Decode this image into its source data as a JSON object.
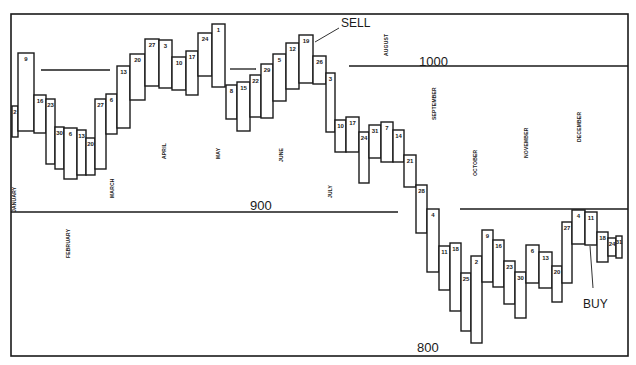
{
  "chart_data": {
    "type": "bar",
    "subtype": "weekly high-low range (floating box) chart",
    "title": "",
    "xlabel": "Week (day of month)",
    "ylabel": "Index level",
    "ylim": [
      780,
      1020
    ],
    "grid": false,
    "reference_lines": [
      {
        "label": "1000",
        "value": 1000
      },
      {
        "label": "900",
        "value": 900
      },
      {
        "label": "800",
        "value": 800
      }
    ],
    "months": [
      "JANUARY",
      "FEBRUARY",
      "MARCH",
      "APRIL",
      "MAY",
      "JUNE",
      "JULY",
      "AUGUST",
      "SEPTEMBER",
      "OCTOBER",
      "NOVEMBER",
      "DECEMBER"
    ],
    "annotations": [
      {
        "text": "SELL",
        "at_week": "Jun 19"
      },
      {
        "text": "BUY",
        "at_week": "Dec 11"
      }
    ],
    "categories": [
      "Jan 2",
      "Jan 9",
      "Jan 16",
      "Jan 23",
      "Jan 30",
      "Feb 6",
      "Feb 13",
      "Feb 20",
      "Feb 27",
      "Mar 6",
      "Mar 13",
      "Mar 20",
      "Mar 27",
      "Apr 3",
      "Apr 10",
      "Apr 17",
      "Apr 24",
      "May 1",
      "May 8",
      "May 15",
      "May 22",
      "May 29",
      "Jun 5",
      "Jun 12",
      "Jun 19",
      "Jun 26",
      "Jul 3",
      "Jul 10",
      "Jul 17",
      "Jul 24",
      "Jul 31",
      "Aug 7",
      "Aug 14",
      "Aug 21",
      "Aug 28",
      "Sep 4",
      "Sep 11",
      "Sep 18",
      "Sep 25",
      "Oct 2",
      "Oct 9",
      "Oct 16",
      "Oct 23",
      "Oct 30",
      "Nov 6",
      "Nov 13",
      "Nov 20",
      "Nov 27",
      "Dec 4",
      "Dec 11",
      "Dec 18",
      "Dec 24",
      "Dec 31"
    ],
    "series": [
      {
        "name": "High",
        "values": [
          956,
          982,
          965,
          963,
          951,
          951,
          950,
          947,
          963,
          965,
          975,
          980,
          986,
          986,
          979,
          981,
          989,
          992,
          966,
          967,
          970,
          974,
          980,
          984,
          987,
          978,
          971,
          952,
          953,
          946,
          949,
          950,
          947,
          937,
          924,
          913,
          896,
          897,
          884,
          890,
          902,
          898,
          888,
          884,
          896,
          893,
          887,
          907,
          912,
          912,
          902,
          900,
          900
        ]
      },
      {
        "name": "Low",
        "values": [
          943,
          948,
          947,
          934,
          932,
          928,
          930,
          930,
          932,
          949,
          952,
          964,
          970,
          969,
          968,
          966,
          974,
          969,
          955,
          950,
          955,
          955,
          963,
          968,
          970,
          970,
          945,
          936,
          936,
          929,
          943,
          941,
          941,
          931,
          910,
          883,
          875,
          866,
          857,
          852,
          875,
          873,
          865,
          859,
          875,
          873,
          866,
          875,
          896,
          896,
          883,
          886,
          885
        ]
      }
    ],
    "boxes": [
      {
        "label": "2",
        "x": 12,
        "w": 6,
        "top": 106,
        "bottom": 137
      },
      {
        "label": "9",
        "x": 18,
        "w": 16,
        "top": 53,
        "bottom": 131
      },
      {
        "label": "16",
        "x": 34,
        "w": 12,
        "top": 95,
        "bottom": 133
      },
      {
        "label": "23",
        "x": 46,
        "w": 9,
        "top": 99,
        "bottom": 164
      },
      {
        "label": "30",
        "x": 55,
        "w": 9,
        "top": 127,
        "bottom": 169
      },
      {
        "label": "6",
        "x": 64,
        "w": 13,
        "top": 128,
        "bottom": 179
      },
      {
        "label": "13",
        "x": 77,
        "w": 9,
        "top": 130,
        "bottom": 175
      },
      {
        "label": "20",
        "x": 86,
        "w": 9,
        "top": 138,
        "bottom": 175
      },
      {
        "label": "27",
        "x": 95,
        "w": 11,
        "top": 99,
        "bottom": 169
      },
      {
        "label": "6",
        "x": 106,
        "w": 11,
        "top": 94,
        "bottom": 134
      },
      {
        "label": "13",
        "x": 117,
        "w": 13,
        "top": 66,
        "bottom": 128
      },
      {
        "label": "20",
        "x": 130,
        "w": 15,
        "top": 54,
        "bottom": 100
      },
      {
        "label": "27",
        "x": 145,
        "w": 14,
        "top": 39,
        "bottom": 86
      },
      {
        "label": "3",
        "x": 159,
        "w": 13,
        "top": 40,
        "bottom": 88
      },
      {
        "label": "10",
        "x": 172,
        "w": 14,
        "top": 57,
        "bottom": 90
      },
      {
        "label": "17",
        "x": 186,
        "w": 12,
        "top": 51,
        "bottom": 95
      },
      {
        "label": "24",
        "x": 198,
        "w": 14,
        "top": 33,
        "bottom": 76
      },
      {
        "label": "1",
        "x": 212,
        "w": 13,
        "top": 24,
        "bottom": 87
      },
      {
        "label": "8",
        "x": 226,
        "w": 11,
        "top": 85,
        "bottom": 119
      },
      {
        "label": "15",
        "x": 237,
        "w": 13,
        "top": 82,
        "bottom": 131
      },
      {
        "label": "22",
        "x": 250,
        "w": 11,
        "top": 75,
        "bottom": 117
      },
      {
        "label": "29",
        "x": 261,
        "w": 12,
        "top": 64,
        "bottom": 118
      },
      {
        "label": "5",
        "x": 273,
        "w": 13,
        "top": 54,
        "bottom": 101
      },
      {
        "label": "12",
        "x": 286,
        "w": 13,
        "top": 43,
        "bottom": 89
      },
      {
        "label": "19",
        "x": 299,
        "w": 14,
        "top": 35,
        "bottom": 83
      },
      {
        "label": "26",
        "x": 313,
        "w": 13,
        "top": 56,
        "bottom": 84
      },
      {
        "label": "3",
        "x": 326,
        "w": 9,
        "top": 73,
        "bottom": 132
      },
      {
        "label": "10",
        "x": 335,
        "w": 11,
        "top": 120,
        "bottom": 152
      },
      {
        "label": "17",
        "x": 346,
        "w": 13,
        "top": 117,
        "bottom": 152
      },
      {
        "label": "24",
        "x": 359,
        "w": 10,
        "top": 132,
        "bottom": 183
      },
      {
        "label": "31",
        "x": 369,
        "w": 12,
        "top": 125,
        "bottom": 158
      },
      {
        "label": "7",
        "x": 381,
        "w": 12,
        "top": 122,
        "bottom": 162
      },
      {
        "label": "14",
        "x": 393,
        "w": 11,
        "top": 130,
        "bottom": 162
      },
      {
        "label": "21",
        "x": 404,
        "w": 12,
        "top": 155,
        "bottom": 187
      },
      {
        "label": "28",
        "x": 416,
        "w": 11,
        "top": 185,
        "bottom": 233
      },
      {
        "label": "4",
        "x": 427,
        "w": 12,
        "top": 209,
        "bottom": 272
      },
      {
        "label": "11",
        "x": 439,
        "w": 11,
        "top": 246,
        "bottom": 290
      },
      {
        "label": "18",
        "x": 450,
        "w": 11,
        "top": 243,
        "bottom": 311
      },
      {
        "label": "25",
        "x": 461,
        "w": 10,
        "top": 273,
        "bottom": 331
      },
      {
        "label": "2",
        "x": 471,
        "w": 11,
        "top": 256,
        "bottom": 343
      },
      {
        "label": "9",
        "x": 482,
        "w": 11,
        "top": 230,
        "bottom": 282
      },
      {
        "label": "16",
        "x": 493,
        "w": 11,
        "top": 240,
        "bottom": 287
      },
      {
        "label": "23",
        "x": 504,
        "w": 11,
        "top": 261,
        "bottom": 304
      },
      {
        "label": "30",
        "x": 515,
        "w": 11,
        "top": 272,
        "bottom": 318
      },
      {
        "label": "6",
        "x": 526,
        "w": 13,
        "top": 245,
        "bottom": 283
      },
      {
        "label": "13",
        "x": 539,
        "w": 13,
        "top": 252,
        "bottom": 288
      },
      {
        "label": "20",
        "x": 552,
        "w": 10,
        "top": 266,
        "bottom": 302
      },
      {
        "label": "27",
        "x": 562,
        "w": 10,
        "top": 222,
        "bottom": 283
      },
      {
        "label": "4",
        "x": 572,
        "w": 13,
        "top": 210,
        "bottom": 244
      },
      {
        "label": "11",
        "x": 585,
        "w": 12,
        "top": 212,
        "bottom": 245
      },
      {
        "label": "18",
        "x": 597,
        "w": 11,
        "top": 232,
        "bottom": 262
      },
      {
        "label": "24",
        "x": 608,
        "w": 8,
        "top": 238,
        "bottom": 256
      },
      {
        "label": "31",
        "x": 616,
        "w": 6,
        "top": 236,
        "bottom": 258
      }
    ]
  },
  "labels": {
    "level_1000": "1000",
    "level_900": "900",
    "level_800": "800",
    "sell": "SELL",
    "buy": "BUY",
    "month_january": "JANUARY",
    "month_february": "FEBRUARY",
    "month_march": "MARCH",
    "month_april": "APRIL",
    "month_may": "MAY",
    "month_june": "JUNE",
    "month_july": "JULY",
    "month_august": "AUGUST",
    "month_september": "SEPTEMBER",
    "month_october": "OCTOBER",
    "month_november": "NOVEMBER",
    "month_december": "DECEMBER"
  }
}
